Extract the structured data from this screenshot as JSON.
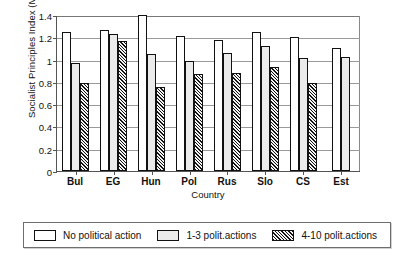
{
  "chart_data": {
    "type": "bar",
    "title": "",
    "xlabel": "Country",
    "ylabel": "Socialist Principles Index (Mean)",
    "categories": [
      "Bul",
      "EG",
      "Hun",
      "Pol",
      "Rus",
      "Slo",
      "CS",
      "Est"
    ],
    "series": [
      {
        "name": "No political action",
        "values": [
          1.25,
          1.27,
          1.4,
          1.21,
          1.18,
          1.25,
          1.2,
          1.1
        ]
      },
      {
        "name": "1-3 polit.actions",
        "values": [
          0.97,
          1.23,
          1.05,
          0.99,
          1.06,
          1.12,
          1.01,
          1.02
        ]
      },
      {
        "name": "4-10 polit.actions",
        "values": [
          0.79,
          1.17,
          0.75,
          0.87,
          0.88,
          0.93,
          0.79,
          null
        ]
      }
    ],
    "ylim": [
      0,
      1.4
    ],
    "ytick_labels": [
      "0",
      "0.2",
      "0.4",
      "0.6",
      "0.8",
      "1",
      "1.2",
      "1.4"
    ],
    "ytick_values": [
      0,
      0.2,
      0.4,
      0.6,
      0.8,
      1.0,
      1.2,
      1.4
    ],
    "grid": true,
    "legend_position": "bottom",
    "legend": [
      "No political action",
      "1-3 polit.actions",
      "4-10 polit.actions"
    ]
  }
}
